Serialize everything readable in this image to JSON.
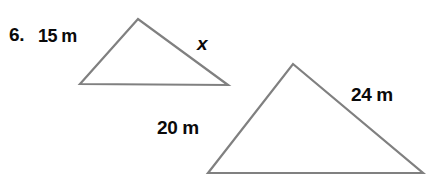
{
  "figure": {
    "problem_number": "6.",
    "background_color": "#ffffff",
    "stroke_color": "#808080",
    "text_color": "#0a0a0a",
    "stroke_width": 2.2,
    "width": 431,
    "height": 184
  },
  "shapes": {
    "small_triangle": {
      "name": "small-triangle",
      "points": "80,84 138,19 228,85",
      "vertices": [
        {
          "x": 80,
          "y": 84
        },
        {
          "x": 138,
          "y": 19
        },
        {
          "x": 228,
          "y": 85
        }
      ]
    },
    "large_triangle": {
      "name": "large-triangle",
      "points": "208,173 293,64 423,173",
      "vertices": [
        {
          "x": 208,
          "y": 173
        },
        {
          "x": 293,
          "y": 64
        },
        {
          "x": 423,
          "y": 173
        }
      ]
    }
  },
  "labels": {
    "small_left_side": "15 m",
    "small_right_side": "x",
    "large_left_side": "20 m",
    "large_right_side": "24 m"
  }
}
